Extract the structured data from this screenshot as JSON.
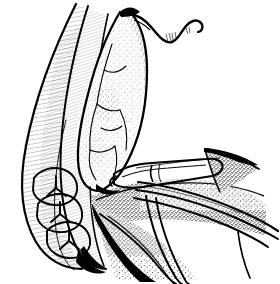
{
  "figure": {
    "title": "Surgical removal of impacted mandibular third molar",
    "caption": "",
    "medium": "pen-and-ink line drawing",
    "domain": "medical-illustration",
    "width": 280,
    "height": 284,
    "background_color": "#ffffff",
    "ink_color": "#000000",
    "shading_techniques": [
      "line-hatching",
      "stippling",
      "contour-line"
    ],
    "labels": [],
    "annotations": [],
    "numbers": []
  },
  "scene": {
    "view": "intra-oral right posterior mandible, buccal aspect",
    "elements": [
      {
        "id": "cheek-retraction",
        "name": "retracted buccal mucosa / cheek",
        "description": "large crescent arc sweeping from upper-left to lower-center, drawn with a heavy outer contour and fine inner hatching",
        "shading": "line-hatching"
      },
      {
        "id": "mucoperiosteal-flap",
        "name": "reflected mucoperiosteal flap",
        "description": "broad tongue-shaped flap lifted upward at center, stippled and crazed with irregular crack-like contour lines",
        "shading": "stippling"
      },
      {
        "id": "flap-tip-curve",
        "name": "free flap margin",
        "description": "thin wavy line trailing off to the upper right from the flap apex",
        "shading": "contour-line"
      },
      {
        "id": "molar-teeth",
        "name": "mandibular molar teeth",
        "description": "three molar occlusal surfaces in the lower-left arch showing Y-shaped fissure patterns",
        "count": 3,
        "shading": "contour-line"
      },
      {
        "id": "alveolar-bone",
        "name": "alveolar bone / extraction socket region",
        "description": "densely stippled region at lower center-right indicating cut bone and granular tissue",
        "shading": "stippling"
      },
      {
        "id": "surgical-instrument",
        "name": "dental elevator / periosteal instrument",
        "description": "straight-shafted instrument entering from the right, blade engaged beneath the flap, handle shown with parallel edge lines and a notched working tip",
        "shading": "contour-line"
      },
      {
        "id": "lingual-tissue-wedge",
        "name": "lingual soft-tissue wedge",
        "description": "small triangular stippled wedge at upper right of the instrument shaft",
        "shading": "stippling"
      }
    ]
  }
}
